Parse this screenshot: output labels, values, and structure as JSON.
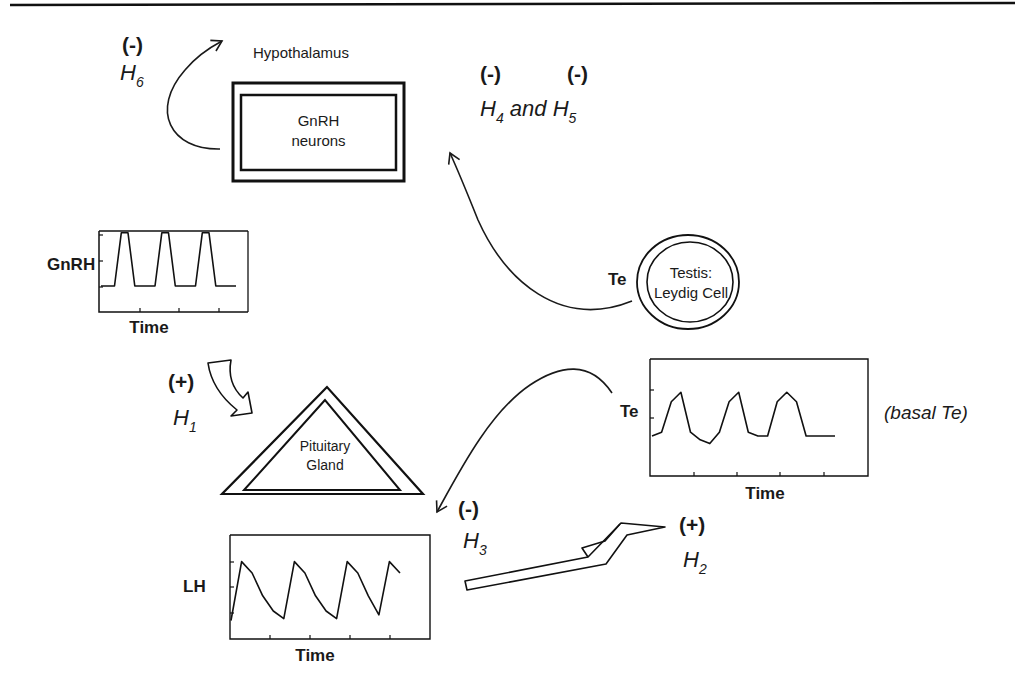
{
  "header": {
    "rule": true
  },
  "organs": {
    "hypothalamus": {
      "title": "Hypothalamus",
      "label_line1": "GnRH",
      "label_line2": "neurons"
    },
    "pituitary": {
      "label_line1": "Pituitary",
      "label_line2": "Gland"
    },
    "testis": {
      "label_line1": "Testis:",
      "label_line2": "Leydig Cell",
      "output_label": "Te"
    }
  },
  "hypotheses": {
    "h1": {
      "sign": "(+)",
      "name": "H",
      "sub": "1"
    },
    "h2": {
      "sign": "(+)",
      "name": "H",
      "sub": "2"
    },
    "h3": {
      "sign": "(-)",
      "name": "H",
      "sub": "3"
    },
    "h45": {
      "sign_a": "(-)",
      "sign_b": "(-)",
      "name_a": "H",
      "sub_a": "4",
      "joiner": "and",
      "name_b": "H",
      "sub_b": "5"
    },
    "h6": {
      "sign": "(-)",
      "name": "H",
      "sub": "6"
    }
  },
  "annotations": {
    "basal_te": "(basal Te)"
  },
  "chart_data": [
    {
      "type": "line",
      "title": "GnRH pulses",
      "xlabel": "Time",
      "ylabel": "GnRH",
      "grid": false,
      "x": [
        0,
        1,
        2,
        3,
        4,
        5,
        6,
        7,
        8,
        9,
        10,
        11,
        12,
        13,
        14,
        15,
        16,
        17,
        18,
        19,
        20
      ],
      "values": [
        1,
        1,
        1,
        4.8,
        4.8,
        1,
        1,
        1,
        1,
        4.8,
        4.8,
        1,
        1,
        1,
        1,
        4.8,
        4.8,
        1,
        1,
        1,
        1
      ]
    },
    {
      "type": "line",
      "title": "LH pulses",
      "xlabel": "Time",
      "ylabel": "LH",
      "grid": false,
      "x": [
        0,
        1,
        2,
        3,
        4,
        5,
        6,
        7,
        8,
        9,
        10,
        11,
        12,
        13,
        14,
        15,
        16
      ],
      "values": [
        0.5,
        3.6,
        3.0,
        1.8,
        1.0,
        0.6,
        3.6,
        3.0,
        1.8,
        1.0,
        0.6,
        3.6,
        3.0,
        1.8,
        0.8,
        3.6,
        3.0
      ]
    },
    {
      "type": "line",
      "title": "Te pulses",
      "xlabel": "Time",
      "ylabel": "Te",
      "grid": false,
      "annotation": "(basal Te)",
      "x": [
        0,
        1,
        2,
        3,
        4,
        5,
        6,
        7,
        8,
        9,
        10,
        11,
        12,
        13,
        14,
        15,
        16,
        17,
        18,
        19
      ],
      "values": [
        1.0,
        1.2,
        2.8,
        3.3,
        1.2,
        0.8,
        0.6,
        1.2,
        2.8,
        3.3,
        1.2,
        1.0,
        1.0,
        2.8,
        3.3,
        2.8,
        1.0,
        1.0,
        1.0,
        1.0
      ]
    }
  ]
}
